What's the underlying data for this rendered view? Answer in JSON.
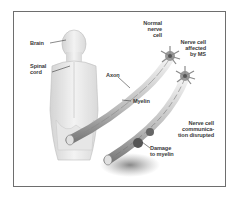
{
  "figure": {
    "labels": {
      "brain": "Brain",
      "spinal_cord_1": "Spinal",
      "spinal_cord_2": "cord",
      "axon": "Axon",
      "myelin": "Myelin",
      "normal_1": "Normal",
      "normal_2": "nerve",
      "normal_3": "cell",
      "affected_1": "Nerve cell",
      "affected_2": "affected",
      "affected_3": "by MS",
      "disrupted_1": "Nerve cell",
      "disrupted_2": "communica-",
      "disrupted_3": "tion disrupted",
      "damage_1": "Damage",
      "damage_2": "to myelin"
    },
    "colors": {
      "frame": "#6e6e6e",
      "ink": "#3a3a3a",
      "shade": "#8a8a8a"
    }
  }
}
